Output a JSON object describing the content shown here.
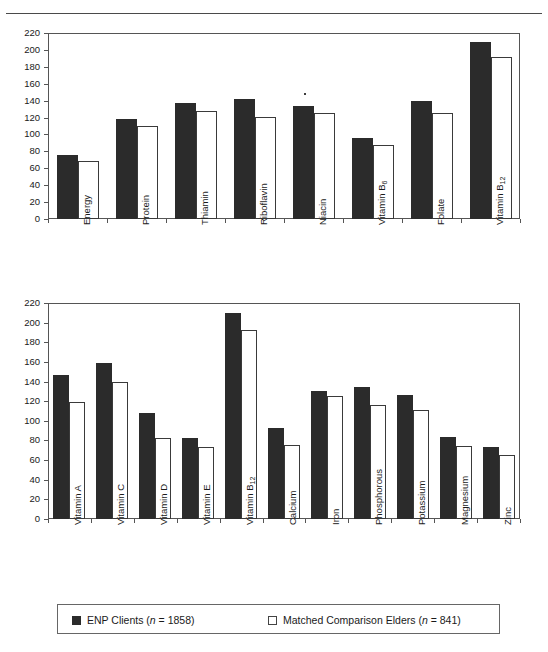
{
  "figure": {
    "background": "#ffffff",
    "series_colors": {
      "enp": "#2b2b2b",
      "matched": "#ffffff"
    }
  },
  "legend": {
    "items": [
      {
        "key": "enp",
        "style": "filled",
        "label": "ENP Clients (n = 1858)",
        "name_text": "ENP Clients",
        "n_text": "(n = 1858)"
      },
      {
        "key": "matched",
        "style": "hollow",
        "label": "Matched Comparison Elders  (n = 841)",
        "name_text": "Matched Comparison Elders",
        "n_text": "(n = 841)"
      }
    ]
  },
  "chart_data": [
    {
      "type": "bar",
      "title": "",
      "xlabel": "",
      "ylabel": "",
      "ylim": [
        0,
        220
      ],
      "yticks": [
        0,
        20,
        40,
        60,
        80,
        100,
        120,
        140,
        160,
        180,
        200,
        220
      ],
      "grid": false,
      "legend_position": "bottom",
      "categories": [
        "Energy",
        "Protein",
        "Thiamin",
        "Riboflavin",
        "Niacin",
        "Vitamin B6",
        "Folate",
        "Vitamin B12"
      ],
      "category_labels_html": [
        "Energy",
        "Protein",
        "Thiamin",
        "Riboflavin",
        "Niacin",
        "Vitamin B<sub>6</sub>",
        "Folate",
        "Vitamin B<sub>12</sub>"
      ],
      "series": [
        {
          "name": "ENP Clients (n = 1858)",
          "values": [
            76,
            118,
            137,
            142,
            134,
            96,
            139,
            209
          ]
        },
        {
          "name": "Matched Comparison Elders (n = 841)",
          "values": [
            69,
            110,
            128,
            121,
            125,
            87,
            125,
            192
          ]
        }
      ]
    },
    {
      "type": "bar",
      "title": "",
      "xlabel": "",
      "ylabel": "",
      "ylim": [
        0,
        220
      ],
      "yticks": [
        0,
        20,
        40,
        60,
        80,
        100,
        120,
        140,
        160,
        180,
        200,
        220
      ],
      "grid": false,
      "legend_position": "bottom",
      "categories": [
        "Vitamin A",
        "Vitamin C",
        "Vitamin D",
        "Vitamin E",
        "Vitamin B12",
        "Calcium",
        "Iron",
        "Phosphorous",
        "Potassium",
        "Magnesium",
        "Zinc"
      ],
      "category_labels_html": [
        "Vitamin A",
        "Vitamin C",
        "Vitamin D",
        "Vitamin E",
        "Vitamin B<sub>12</sub>",
        "Calcium",
        "Iron",
        "Phosphorous",
        "Potassium",
        "Magnesium",
        "Zinc"
      ],
      "series": [
        {
          "name": "ENP Clients (n = 1858)",
          "values": [
            147,
            159,
            108,
            83,
            210,
            93,
            130,
            134,
            126,
            84,
            73
          ]
        },
        {
          "name": "Matched Comparison Elders (n = 841)",
          "values": [
            119,
            140,
            83,
            73,
            192,
            75,
            125,
            116,
            111,
            74,
            65
          ]
        }
      ]
    }
  ]
}
